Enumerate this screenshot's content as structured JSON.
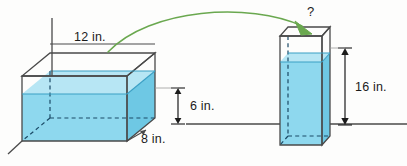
{
  "figure": {
    "colors": {
      "water_front": "#8ed8ee",
      "water_side": "#6ec8e4",
      "water_surface": "#b7e6f4",
      "outline": "#4a4a4a",
      "arrow_green": "#6aa84f",
      "ground_line": "#4a4a4a",
      "text": "#1b1b1b"
    },
    "left_container": {
      "name": "rectangular-prism-tank",
      "labels": {
        "length": "12 in.",
        "depth": "8 in.",
        "water_height": "6 in."
      },
      "water_height_value": 6,
      "length_value": 12,
      "depth_value": 8,
      "units": "in."
    },
    "right_container": {
      "name": "tall-square-prism-tank",
      "labels": {
        "unknown": "?",
        "height": "16 in."
      },
      "height_value": 16,
      "units": "in."
    },
    "transfer_arrow": {
      "name": "pour-arrow",
      "description": "curved green arrow from left tank to right tank"
    }
  }
}
